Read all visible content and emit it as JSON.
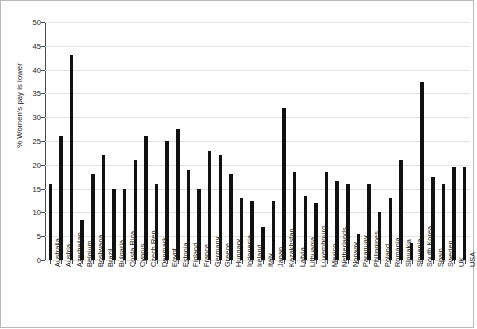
{
  "chart_data": {
    "type": "bar",
    "title": "",
    "xlabel": "",
    "ylabel": "% Women's pay is lower",
    "ylim": [
      0,
      50
    ],
    "ytick_step": 5,
    "yticks": [
      0,
      5,
      10,
      15,
      20,
      25,
      30,
      35,
      40,
      45,
      50
    ],
    "grid": true,
    "legend": "none",
    "bar_color": "#111111",
    "categories": [
      "Australia",
      "Austria",
      "Azerbaijan",
      "Belgium",
      "Bostwana",
      "Brazil",
      "Bulgaria",
      "Costa Rica",
      "Cyprus",
      "Czech Rep.",
      "Denmark",
      "Egypt",
      "Estonia",
      "Finland",
      "France",
      "Germany",
      "Greece",
      "Hungary",
      "Indonesia",
      "Ireland",
      "Italy",
      "Japan",
      "Kazakhstan",
      "Latvia",
      "Lithuania",
      "Luxembourg",
      "Mexico",
      "Netherlands",
      "Norway",
      "Paraguay",
      "Philippines",
      "Poland",
      "Romania",
      "Slovakia",
      "Slovenia",
      "South Korea",
      "Spain",
      "Sweden",
      "UK",
      "USA"
    ],
    "values": [
      16,
      26,
      43,
      8.5,
      18,
      22,
      15,
      15,
      21,
      26,
      16,
      25,
      27.5,
      19,
      15,
      23,
      22,
      18,
      13,
      12.5,
      7,
      12.5,
      32,
      18.5,
      13.5,
      12,
      18.5,
      16.5,
      16,
      5.5,
      16,
      10,
      13,
      21,
      3.5,
      37.5,
      17.5,
      16,
      19.5,
      19.5
    ]
  }
}
